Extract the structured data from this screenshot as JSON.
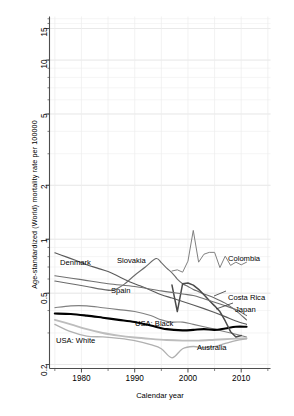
{
  "chart_data": {
    "type": "line",
    "title": "",
    "xlabel": "Calendar year",
    "ylabel": "Age-standardized (World) mortality rate per 100000",
    "yscale": "log",
    "xlim": [
      1974,
      2015.5
    ],
    "ylim": [
      0.19,
      17.5
    ],
    "grid": true,
    "legend_position": "inline-annotations",
    "ytick_labels": [
      "0.2",
      "0.5",
      "1",
      "2",
      "5",
      "10",
      "15"
    ],
    "ytick_values": [
      0.2,
      0.5,
      1,
      2,
      5,
      10,
      15
    ],
    "xtick_labels": [
      "1980",
      "1990",
      "2000",
      "2010"
    ],
    "xtick_values": [
      1980,
      1990,
      2000,
      2010
    ],
    "xtick_minor": [
      1975,
      1985,
      1995,
      2005,
      2015
    ],
    "series": [
      {
        "name": "Denmark",
        "color": "#5a5a5a",
        "width": 1.1,
        "x": [
          1975,
          1977,
          1979,
          1981,
          1983,
          1985,
          1987,
          1989,
          1991,
          1993,
          1995,
          1997,
          1999,
          2001,
          2003,
          2005,
          2007,
          2009,
          2011
        ],
        "y": [
          0.84,
          0.8,
          0.76,
          0.72,
          0.69,
          0.66,
          0.62,
          0.58,
          0.55,
          0.52,
          0.49,
          0.47,
          0.45,
          0.43,
          0.41,
          0.39,
          0.37,
          0.35,
          0.335
        ]
      },
      {
        "name": "Slovakia",
        "color": "#6b6b6b",
        "width": 1.1,
        "x": [
          1975,
          1978,
          1981,
          1984,
          1986,
          1988,
          1990,
          1992,
          1994,
          1995,
          1996,
          1997,
          1998,
          1999,
          2000,
          2001,
          2002,
          2003,
          2005,
          2007,
          2009,
          2011
        ],
        "y": [
          0.585,
          0.565,
          0.545,
          0.525,
          0.52,
          0.56,
          0.63,
          0.7,
          0.78,
          0.74,
          0.69,
          0.65,
          0.6,
          0.565,
          0.545,
          0.525,
          0.51,
          0.495,
          0.47,
          0.44,
          0.4,
          0.355
        ]
      },
      {
        "name": "Spain",
        "color": "#808080",
        "width": 1.1,
        "x": [
          1975,
          1978,
          1981,
          1984,
          1987,
          1990,
          1993,
          1995,
          1997,
          1999,
          2001,
          2003,
          2005,
          2007,
          2009,
          2011
        ],
        "y": [
          0.415,
          0.425,
          0.425,
          0.415,
          0.405,
          0.395,
          0.375,
          0.355,
          0.345,
          0.345,
          0.335,
          0.325,
          0.315,
          0.305,
          0.295,
          0.285
        ]
      },
      {
        "name": "USA: Black",
        "color": "#000000",
        "width": 2.1,
        "x": [
          1975,
          1978,
          1981,
          1984,
          1987,
          1990,
          1993,
          1996,
          1999,
          2001,
          2003,
          2005,
          2007,
          2009,
          2011
        ],
        "y": [
          0.385,
          0.383,
          0.375,
          0.365,
          0.355,
          0.345,
          0.33,
          0.315,
          0.31,
          0.312,
          0.315,
          0.312,
          0.318,
          0.325,
          0.325
        ]
      },
      {
        "name": "USA: White",
        "color": "#bdbdbd",
        "width": 1.9,
        "x": [
          1975,
          1978,
          1981,
          1984,
          1987,
          1990,
          1993,
          1996,
          1999,
          2002,
          2005,
          2008,
          2011
        ],
        "y": [
          0.355,
          0.335,
          0.315,
          0.3,
          0.29,
          0.283,
          0.278,
          0.274,
          0.272,
          0.272,
          0.275,
          0.278,
          0.28
        ]
      },
      {
        "name": "Colombia",
        "color": "#808080",
        "width": 1.0,
        "x": [
          1997,
          1998,
          1999,
          2000,
          2001,
          2002,
          2003,
          2004,
          2005,
          2006,
          2007,
          2008,
          2009,
          2010,
          2011
        ],
        "y": [
          0.665,
          0.675,
          0.655,
          0.755,
          1.12,
          0.745,
          0.825,
          0.845,
          0.845,
          0.695,
          0.805,
          0.715,
          0.745,
          0.72,
          0.745
        ]
      },
      {
        "name": "Costa Rica",
        "color": "#4a4a4a",
        "width": 1.5,
        "x": [
          1997,
          1998,
          1999,
          2000,
          2001,
          2002,
          2003,
          2004,
          2005,
          2006,
          2007,
          2008,
          2009,
          2010
        ],
        "y": [
          0.555,
          0.395,
          0.565,
          0.57,
          0.555,
          0.525,
          0.49,
          0.455,
          0.425,
          0.395,
          0.35,
          0.305,
          0.285,
          0.29
        ]
      },
      {
        "name": "Japan",
        "color": "#707070",
        "width": 1.1,
        "x": [
          1975,
          1980,
          1985,
          1990,
          1995,
          1999,
          2001,
          2003,
          2005,
          2007,
          2009,
          2011
        ],
        "y": [
          0.625,
          0.595,
          0.565,
          0.545,
          0.515,
          0.495,
          0.485,
          0.465,
          0.445,
          0.425,
          0.405,
          0.375
        ]
      },
      {
        "name": "Australia",
        "color": "#b0b0b0",
        "width": 1.3,
        "x": [
          1975,
          1978,
          1981,
          1984,
          1987,
          1990,
          1993,
          1995,
          1997,
          1999,
          2001,
          2003,
          2005,
          2007,
          2009,
          2011
        ],
        "y": [
          0.335,
          0.305,
          0.288,
          0.285,
          0.28,
          0.272,
          0.258,
          0.245,
          0.218,
          0.245,
          0.252,
          0.248,
          0.252,
          0.262,
          0.272,
          0.278
        ]
      }
    ],
    "annotations": [
      {
        "label": "Denmark",
        "x": 60,
        "y": 258
      },
      {
        "label": "Slovakia",
        "x": 117,
        "y": 256
      },
      {
        "label": "Spain",
        "x": 111,
        "y": 286
      },
      {
        "label": "USA: Black",
        "x": 135,
        "y": 319
      },
      {
        "label": "USA: White",
        "x": 56,
        "y": 336
      },
      {
        "label": "Colombia",
        "x": 228,
        "y": 254
      },
      {
        "label": "Costa Rica",
        "x": 228,
        "y": 293
      },
      {
        "label": "Japan",
        "x": 235,
        "y": 305
      },
      {
        "label": "Australia",
        "x": 197,
        "y": 343
      }
    ]
  }
}
